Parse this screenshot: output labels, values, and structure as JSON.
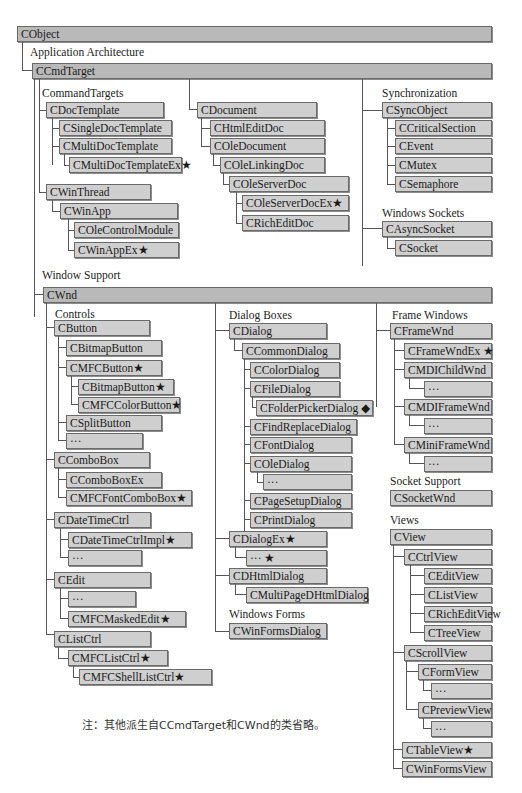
{
  "colors": {
    "box_fill": "#cfcfcf",
    "top_box_fill": "#b9b9b9",
    "border": "#6a6a6a",
    "line": "#555555"
  },
  "markers": {
    "star": "★",
    "diamond": "◆"
  },
  "sections": {
    "application_architecture": "Application Architecture",
    "command_targets": "CommandTargets",
    "synchronization": "Synchronization",
    "windows_sockets": "Windows Sockets",
    "window_support": "Window Support",
    "controls": "Controls",
    "dialog_boxes": "Dialog Boxes",
    "frame_windows": "Frame Windows",
    "socket_support": "Socket Support",
    "views": "Views",
    "windows_forms": "Windows Forms"
  },
  "classes": {
    "cobject": "CObject",
    "ccmdtarget": "CCmdTarget",
    "cdoctemplate": "CDocTemplate",
    "csingledoctemplate": "CSingleDocTemplate",
    "cmultidoctemplate": "CMultiDocTemplate",
    "cmultidoctemplateex": "CMultiDocTemplateEx★",
    "cwinthread": "CWinThread",
    "cwinapp": "CWinApp",
    "colecontrolmodule": "COleControlModule",
    "cwinappex": "CWinAppEx★",
    "cdocument": "CDocument",
    "chtmleditdoc": "CHtmlEditDoc",
    "coledocument": "COleDocument",
    "colelinkingdoc": "COleLinkingDoc",
    "coleserverdoc": "COleServerDoc",
    "coleserverdocex": "COleServerDocEx★",
    "cricheditdoc": "CRichEditDoc",
    "csyncobject": "CSyncObject",
    "ccriticalsection": "CCriticalSection",
    "cevent": "CEvent",
    "cmutex": "CMutex",
    "csemaphore": "CSemaphore",
    "casyncsocket": "CAsyncSocket",
    "csocket": "CSocket",
    "cwnd": "CWnd",
    "cbutton": "CButton",
    "cbitmapbutton": "CBitmapButton",
    "cmfcbutton": "CMFCButton★",
    "cbitmapbutton2": "CBitmapButton★",
    "cmfccolorbutton": "CMFCColorButton★",
    "csplitbutton": "CSplitButton",
    "button_more": "···",
    "ccombobox": "CComboBox",
    "ccomboboxex": "CComboBoxEx",
    "cmfcfontcombobox": "CMFCFontComboBox★",
    "cdatetimectrl": "CDateTimeCtrl",
    "cdatetimectrlimpl": "CDateTimeCtrlImpl★",
    "datetime_more": "···",
    "cedit": "CEdit",
    "edit_more": "···",
    "cmfcmaskededit": "CMFCMaskedEdit★",
    "clistctrl": "CListCtrl",
    "cmfclistctrl": "CMFCListCtrl★",
    "cmfcshelllistctrl": "CMFCShellListCtrl★",
    "cdialog": "CDialog",
    "ccommondialog": "CCommonDialog",
    "ccolordialog": "CColorDialog",
    "cfiledialog": "CFileDialog",
    "cfolderpickerdialog": "CFolderPickerDialog ◆",
    "cfindreplacedialog": "CFindReplaceDialog",
    "cfontdialog": "CFontDialog",
    "coledialog": "COleDialog",
    "oledialog_more": "···",
    "cpagesetupdialog": "CPageSetupDialog",
    "cprintdialog": "CPrintDialog",
    "cdialogex": "CDialogEx★",
    "dialogex_more": "··· ★",
    "cdhtmldialog": "CDHtmlDialog",
    "cmultipagedhtmldialog": "CMultiPageDHtmlDialog",
    "cwinformsdialog": "CWinFormsDialog",
    "cframewnd": "CFrameWnd",
    "cframewndex": "CFrameWndEx ★",
    "cmdichildwnd": "CMDIChildWnd",
    "mdichild_more": "···",
    "cmdiframewnd": "CMDIFrameWnd",
    "mdiframe_more": "···",
    "cminiframewnd": "CMiniFrameWnd",
    "miniframe_more": "···",
    "csocketwnd": "CSocketWnd",
    "cview": "CView",
    "cctrlview": "CCtrlView",
    "cEditview": "CEditView",
    "clistview": "CListView",
    "cricheditview": "CRichEditView",
    "ctreeview": "CTreeView",
    "cscrollview": "CScrollView",
    "cformview": "CFormView",
    "formview_more": "···",
    "cpreviewview": "CPreviewView",
    "previewview_more": "···",
    "ctableview": "CTableView★",
    "cwinformsview": "CWinFormsView"
  },
  "note": "注：其他派生自CCmdTarget和CWnd的类省略。"
}
